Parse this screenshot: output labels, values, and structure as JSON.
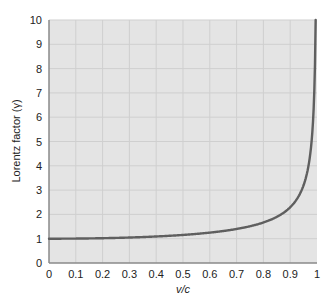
{
  "chart_data": {
    "type": "line",
    "title": "",
    "xlabel": "v/c",
    "ylabel": "Lorentz factor (γ)",
    "xlim": [
      0,
      1
    ],
    "ylim": [
      0,
      10
    ],
    "grid": true,
    "legend": null,
    "x_ticks": [
      "0",
      "0.1",
      "0.2",
      "0.3",
      "0.4",
      "0.5",
      "0.6",
      "0.7",
      "0.8",
      "0.9",
      "1"
    ],
    "y_ticks": [
      "0",
      "1",
      "2",
      "3",
      "4",
      "5",
      "6",
      "7",
      "8",
      "9",
      "10"
    ],
    "series": [
      {
        "name": "Lorentz factor",
        "formula": "γ = 1 / sqrt(1 - (v/c)^2)",
        "x": [
          0,
          0.1,
          0.2,
          0.3,
          0.4,
          0.5,
          0.6,
          0.7,
          0.8,
          0.9,
          0.95,
          0.98,
          0.99,
          0.995
        ],
        "values": [
          1.0,
          1.01,
          1.02,
          1.05,
          1.09,
          1.15,
          1.25,
          1.4,
          1.67,
          2.29,
          3.2,
          5.03,
          7.09,
          10.01
        ],
        "color": "#5f5f5f"
      }
    ]
  },
  "colors": {
    "plot_background": "#e4e4e4",
    "grid": "#cfcfcf",
    "axis": "#8a8a8a",
    "curve": "#5f5f5f"
  }
}
